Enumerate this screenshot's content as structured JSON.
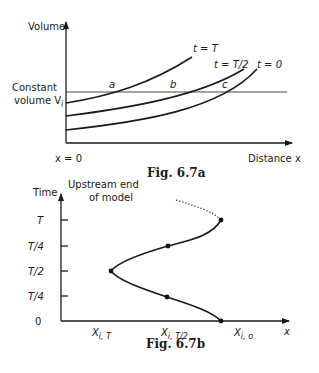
{
  "figure_a": {
    "caption": "Fig. 6.7a",
    "y_axis_label": "Volume",
    "x_axis_label": "Distance x",
    "origin_label": "x = 0",
    "constant_line_label_line1": "Constant",
    "constant_line_label_line2": "volume V",
    "constant_line_label_sub": "i",
    "curves": [
      {
        "label": "t = T"
      },
      {
        "label": "t = T/2"
      },
      {
        "label": "t = 0"
      }
    ],
    "intersection_points": [
      "a",
      "b",
      "c"
    ]
  },
  "figure_b": {
    "caption": "Fig. 6.7b",
    "y_axis_label": "Time",
    "annotation_line1": "Upstream end",
    "annotation_line2": "of model",
    "x_axis_label": "x",
    "y_ticks": [
      "T",
      "T/4",
      "T/2",
      "T/4",
      "0"
    ],
    "x_labels": [
      {
        "main": "X",
        "sub": "i, T"
      },
      {
        "main": "X",
        "sub": "i, T/2"
      },
      {
        "main": "X",
        "sub": "i, o"
      }
    ]
  }
}
